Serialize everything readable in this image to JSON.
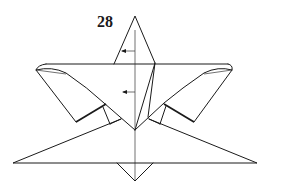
{
  "diagram": {
    "type": "origami-fold-step",
    "step_number": "28",
    "line_color": "#1a1a1a",
    "background": "#ffffff",
    "annotations": [
      {
        "kind": "arrow-left",
        "position": "upper flap near top point"
      },
      {
        "kind": "arrow-left",
        "position": "center body"
      }
    ]
  }
}
